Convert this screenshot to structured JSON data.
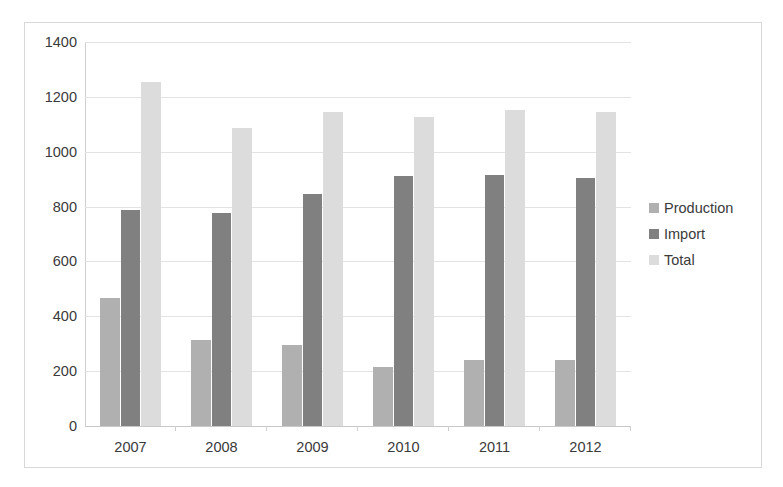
{
  "chart_data": {
    "type": "bar",
    "title": "",
    "subtitle": "",
    "xlabel": "",
    "ylabel": "",
    "categories": [
      "2007",
      "2008",
      "2009",
      "2010",
      "2011",
      "2012"
    ],
    "series": [
      {
        "name": "Production",
        "color": "#b0b0b0",
        "values": [
          466,
          313,
          297,
          215,
          240,
          240
        ]
      },
      {
        "name": "Import",
        "color": "#808080",
        "values": [
          788,
          775,
          846,
          910,
          915,
          905
        ]
      },
      {
        "name": "Total",
        "color": "#dcdcdc",
        "values": [
          1255,
          1088,
          1145,
          1125,
          1152,
          1145
        ]
      }
    ],
    "ylim": [
      0,
      1400
    ],
    "ytick_step": 200,
    "yticks": [
      "1400",
      "1200",
      "1000",
      "800",
      "600",
      "400",
      "200",
      "0"
    ],
    "grid": "horizontal",
    "legend_position": "right",
    "background_color": "#ffffff",
    "gridline_color": "#e3e3e3",
    "border_color": "#d8d8d8",
    "text_color": "#3a3a3a"
  },
  "legend": {
    "items": [
      {
        "label": "Production",
        "color": "#b0b0b0"
      },
      {
        "label": "Import",
        "color": "#808080"
      },
      {
        "label": "Total",
        "color": "#dcdcdc"
      }
    ]
  }
}
